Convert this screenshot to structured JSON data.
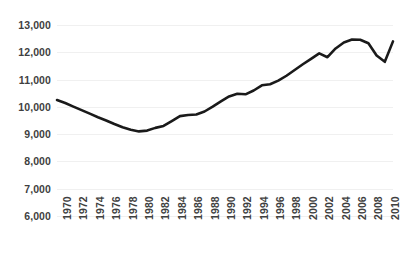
{
  "chart_data": {
    "type": "line",
    "title": "",
    "subtitle": "",
    "xlabel": "",
    "ylabel": "",
    "grid": true,
    "legend": false,
    "legend_position": "none",
    "line_color": "#1a1a1a",
    "gridline_color": "#f0f0f0",
    "tick_label_color": "#3f3f3f",
    "background_color": "#ffffff",
    "xlim": [
      1970,
      2011
    ],
    "ylim": [
      6000,
      13000
    ],
    "y_ticks": [
      13000,
      12000,
      11000,
      10000,
      9000,
      8000,
      7000,
      6000
    ],
    "y_tick_labels": [
      "13,000",
      "12,000",
      "11,000",
      "10,000",
      "9,000",
      "8,000",
      "7,000",
      "6,000"
    ],
    "x_ticks": [
      1970,
      1972,
      1974,
      1976,
      1978,
      1980,
      1982,
      1984,
      1986,
      1988,
      1990,
      1992,
      1994,
      1996,
      1998,
      2000,
      2002,
      2004,
      2006,
      2008,
      2010
    ],
    "x_tick_labels": [
      "1970",
      "1972",
      "1974",
      "1976",
      "1978",
      "1980",
      "1982",
      "1984",
      "1986",
      "1988",
      "1990",
      "1992",
      "1994",
      "1996",
      "1998",
      "2000",
      "2002",
      "2004",
      "2006",
      "2008",
      "2010"
    ],
    "x_tick_rotation": 90,
    "x": [
      1970,
      1971,
      1972,
      1973,
      1974,
      1975,
      1976,
      1977,
      1978,
      1979,
      1980,
      1981,
      1982,
      1983,
      1984,
      1985,
      1986,
      1987,
      1988,
      1989,
      1990,
      1991,
      1992,
      1993,
      1994,
      1995,
      1996,
      1997,
      1998,
      1999,
      2000,
      2001,
      2002,
      2003,
      2004,
      2005,
      2006,
      2007,
      2008,
      2009,
      2010,
      2011
    ],
    "values": [
      10250,
      10140,
      10010,
      9880,
      9750,
      9620,
      9500,
      9370,
      9250,
      9160,
      9100,
      9130,
      9230,
      9300,
      9480,
      9660,
      9700,
      9720,
      9830,
      10010,
      10200,
      10380,
      10480,
      10460,
      10600,
      10790,
      10830,
      10960,
      11140,
      11350,
      11560,
      11760,
      11960,
      11820,
      12140,
      12360,
      12470,
      12460,
      12330,
      11880,
      11650,
      12400
    ],
    "series": [
      {
        "name": "series-1",
        "values": [
          10250,
          10140,
          10010,
          9880,
          9750,
          9620,
          9500,
          9370,
          9250,
          9160,
          9100,
          9130,
          9230,
          9300,
          9480,
          9660,
          9700,
          9720,
          9830,
          10010,
          10200,
          10380,
          10480,
          10460,
          10600,
          10790,
          10830,
          10960,
          11140,
          11350,
          11560,
          11760,
          11960,
          11820,
          12140,
          12360,
          12470,
          12460,
          12330,
          11880,
          11650,
          12400
        ]
      }
    ],
    "annotations": []
  }
}
